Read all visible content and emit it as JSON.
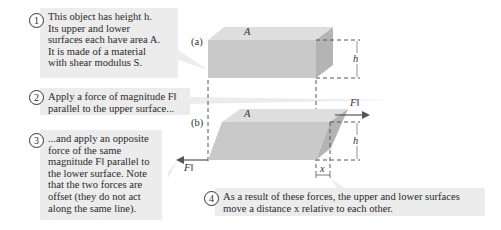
{
  "callouts": [
    {
      "number": "1",
      "text": "This object has height h.\nIts upper and lower\nsurfaces each have area A.\nIt is made of a material\nwith shear modulus S."
    },
    {
      "number": "2",
      "text": "Apply a force of magnitude F‖\nparallel to the upper surface..."
    },
    {
      "number": "3",
      "text": "...and apply an opposite\nforce of the same\nmagnitude F‖ parallel to\nthe lower surface. Note\nthat the two forces are\noffset (they do not act\nalong the same line)."
    },
    {
      "number": "4",
      "text": "As a result of these forces, the upper and lower surfaces\nmove a distance x relative to each other."
    }
  ],
  "labels": {
    "panel_a": "(a)",
    "panel_b": "(b)",
    "area_a_top": "A",
    "area_b_top": "A",
    "height_a": "h",
    "height_b": "h",
    "force_upper": "F‖",
    "force_lower": "F‖",
    "displacement": "x"
  },
  "colors": {
    "callout_bg": "#ececec",
    "block_front": "#c9c9c9",
    "block_top": "#dedede",
    "block_side": "#b4b4b4",
    "arrow": "#555555"
  }
}
